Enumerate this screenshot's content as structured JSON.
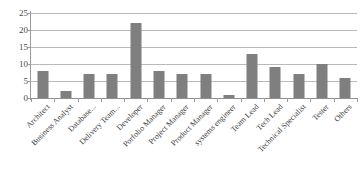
{
  "chart_data": {
    "type": "bar",
    "title": "",
    "subtitle": "",
    "xlabel": "",
    "ylabel": "",
    "ylim": [
      0,
      25
    ],
    "yticks": [
      0,
      5,
      10,
      15,
      20,
      25
    ],
    "grid": true,
    "legend": false,
    "legend_position": "none",
    "bar_color": "#7f7f7f",
    "gridline_color": "#b9b9b9",
    "axis_color": "#9a9a9a",
    "categories": [
      "Architect",
      "Business Analyst",
      "Database...",
      "Delivery Team...",
      "Developer",
      "Porfolio Manager",
      "Project Manager",
      "Product Manager",
      "systems engineer",
      "Team Lead",
      "Tech Lead",
      "Technical Specialist",
      "Tester",
      "Others"
    ],
    "values": [
      8,
      2,
      7,
      7,
      22,
      8,
      7,
      7,
      1,
      13,
      9,
      7,
      10,
      6
    ],
    "series": [
      {
        "name": "Count",
        "values": [
          8,
          2,
          7,
          7,
          22,
          8,
          7,
          7,
          1,
          13,
          9,
          7,
          10,
          6
        ]
      }
    ]
  }
}
